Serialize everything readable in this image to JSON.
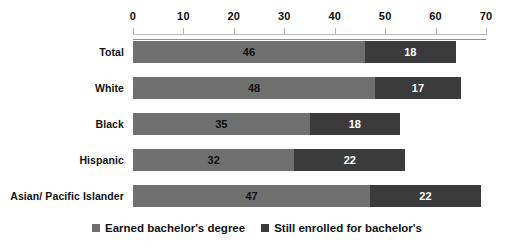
{
  "chart_data": {
    "type": "bar",
    "orientation": "horizontal",
    "stacked": true,
    "title": "",
    "subtitle": "",
    "xlabel": "",
    "ylabel": "",
    "xlim": [
      0,
      70
    ],
    "xticks": [
      0,
      10,
      20,
      30,
      40,
      50,
      60,
      70
    ],
    "xtick_labels": [
      "0",
      "10",
      "20",
      "30",
      "40",
      "50",
      "60",
      "70"
    ],
    "grid": false,
    "legend_position": "bottom",
    "categories": [
      "Total",
      "White",
      "Black",
      "Hispanic",
      "Asian/ Pacific Islander"
    ],
    "series": [
      {
        "name": "Earned bachelor's degree",
        "color": "#6f6f6f",
        "label_color": "#111111",
        "values": [
          46,
          48,
          35,
          32,
          47
        ],
        "value_labels": [
          "46",
          "48",
          "35",
          "32",
          "47"
        ]
      },
      {
        "name": "Still enrolled for bachelor's",
        "color": "#3b3b3b",
        "label_color": "#ffffff",
        "values": [
          18,
          17,
          18,
          22,
          22
        ],
        "value_labels": [
          "18",
          "17",
          "18",
          "22",
          "22"
        ]
      }
    ],
    "totals": [
      64,
      65,
      53,
      54,
      69
    ]
  },
  "legend": {
    "items": [
      {
        "label": "Earned bachelor's degree"
      },
      {
        "label": "Still enrolled for bachelor's"
      }
    ]
  },
  "colors": {
    "series_light": "#6f6f6f",
    "series_dark": "#3b3b3b",
    "axis": "#b5b5b5",
    "text": "#111111",
    "background": "#ffffff"
  }
}
